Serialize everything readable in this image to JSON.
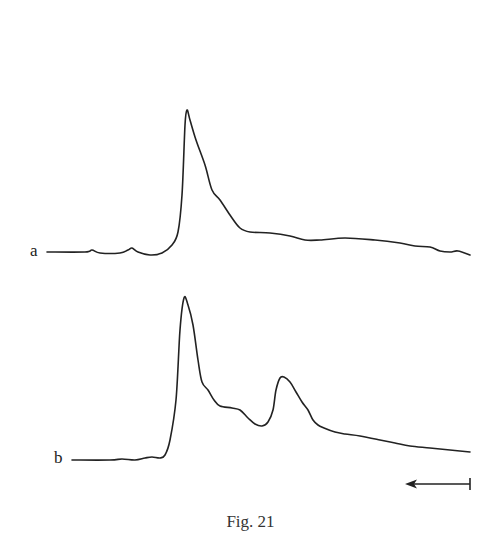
{
  "figure": {
    "caption": "Fig. 21",
    "labels": {
      "a": "a",
      "b": "b"
    }
  },
  "chart_data": {
    "type": "line",
    "title": "Fig. 21",
    "xlabel": "",
    "ylabel": "",
    "grid": false,
    "legend": "inline labels at left of each trace",
    "annotations": [
      "direction arrow pointing left (bottom right)"
    ],
    "series": [
      {
        "name": "a",
        "description": "single sharp peak with shoulder on trailing side, then flat tail",
        "points_px": [
          [
            47,
            252
          ],
          [
            85,
            252
          ],
          [
            92,
            250
          ],
          [
            100,
            253
          ],
          [
            120,
            253
          ],
          [
            128,
            250
          ],
          [
            132,
            248
          ],
          [
            138,
            252
          ],
          [
            150,
            255
          ],
          [
            162,
            253
          ],
          [
            172,
            245
          ],
          [
            178,
            232
          ],
          [
            182,
            195
          ],
          [
            185,
            125
          ],
          [
            187,
            110
          ],
          [
            190,
            120
          ],
          [
            196,
            140
          ],
          [
            205,
            165
          ],
          [
            212,
            190
          ],
          [
            220,
            200
          ],
          [
            230,
            215
          ],
          [
            240,
            228
          ],
          [
            250,
            232
          ],
          [
            270,
            233
          ],
          [
            290,
            236
          ],
          [
            305,
            240
          ],
          [
            320,
            240
          ],
          [
            345,
            238
          ],
          [
            375,
            240
          ],
          [
            400,
            243
          ],
          [
            415,
            246
          ],
          [
            430,
            247
          ],
          [
            440,
            251
          ],
          [
            450,
            252
          ],
          [
            458,
            251
          ],
          [
            470,
            255
          ]
        ]
      },
      {
        "name": "b",
        "description": "sharp main peak, shoulder, valley, then secondary peak, then decaying tail",
        "points_px": [
          [
            72,
            460
          ],
          [
            110,
            460
          ],
          [
            122,
            459
          ],
          [
            135,
            460
          ],
          [
            145,
            458
          ],
          [
            152,
            457
          ],
          [
            160,
            458
          ],
          [
            165,
            455
          ],
          [
            170,
            440
          ],
          [
            176,
            400
          ],
          [
            180,
            330
          ],
          [
            184,
            298
          ],
          [
            188,
            305
          ],
          [
            193,
            325
          ],
          [
            198,
            360
          ],
          [
            202,
            382
          ],
          [
            208,
            390
          ],
          [
            214,
            400
          ],
          [
            220,
            406
          ],
          [
            232,
            408
          ],
          [
            240,
            410
          ],
          [
            248,
            418
          ],
          [
            255,
            424
          ],
          [
            262,
            426
          ],
          [
            268,
            422
          ],
          [
            273,
            410
          ],
          [
            276,
            390
          ],
          [
            280,
            378
          ],
          [
            284,
            377
          ],
          [
            290,
            382
          ],
          [
            296,
            392
          ],
          [
            302,
            402
          ],
          [
            308,
            410
          ],
          [
            313,
            420
          ],
          [
            318,
            425
          ],
          [
            324,
            428
          ],
          [
            335,
            432
          ],
          [
            345,
            434
          ],
          [
            360,
            436
          ],
          [
            380,
            440
          ],
          [
            395,
            443
          ],
          [
            410,
            446
          ],
          [
            430,
            448
          ],
          [
            450,
            450
          ],
          [
            470,
            452
          ]
        ]
      }
    ]
  }
}
